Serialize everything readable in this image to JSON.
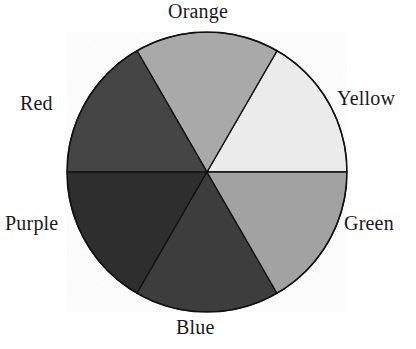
{
  "figure": {
    "kind": "color-wheel-diagram",
    "background_color": "#ffffff",
    "outline_color": "#111111"
  },
  "chart_data": {
    "type": "pie",
    "title": "",
    "subtitle": "",
    "xlabel": "",
    "ylabel": "",
    "legend_position": "radial-outside-labels",
    "grid": false,
    "note": "Six-segment color wheel reproduced in grayscale halftone; each wedge is an equal 60-degree sector.",
    "center": {
      "x": 207,
      "y": 172
    },
    "radius": 140,
    "categories": [
      "Orange",
      "Yellow",
      "Green",
      "Blue",
      "Purple",
      "Red"
    ],
    "values": [
      1,
      1,
      1,
      1,
      1,
      1
    ],
    "percentages": [
      "16.7%",
      "16.7%",
      "16.7%",
      "16.7%",
      "16.7%",
      "16.7%"
    ],
    "slice_angle_degrees": 60,
    "slices": [
      {
        "label": "Orange",
        "start_angle": 60,
        "end_angle": 120,
        "fill": "#a9a9a9",
        "label_position": "top"
      },
      {
        "label": "Yellow",
        "start_angle": 0,
        "end_angle": 60,
        "fill": "#ebebeb",
        "label_position": "upper-right"
      },
      {
        "label": "Green",
        "start_angle": 300,
        "end_angle": 360,
        "fill": "#a2a2a2",
        "label_position": "lower-right"
      },
      {
        "label": "Blue",
        "start_angle": 240,
        "end_angle": 300,
        "fill": "#3c3c3c",
        "label_position": "bottom"
      },
      {
        "label": "Purple",
        "start_angle": 180,
        "end_angle": 240,
        "fill": "#2e2e2e",
        "label_position": "lower-left"
      },
      {
        "label": "Red",
        "start_angle": 120,
        "end_angle": 180,
        "fill": "#444444",
        "label_position": "upper-left"
      }
    ]
  },
  "labels": {
    "orange": "Orange",
    "yellow": "Yellow",
    "green": "Green",
    "blue": "Blue",
    "purple": "Purple",
    "red": "Red"
  }
}
